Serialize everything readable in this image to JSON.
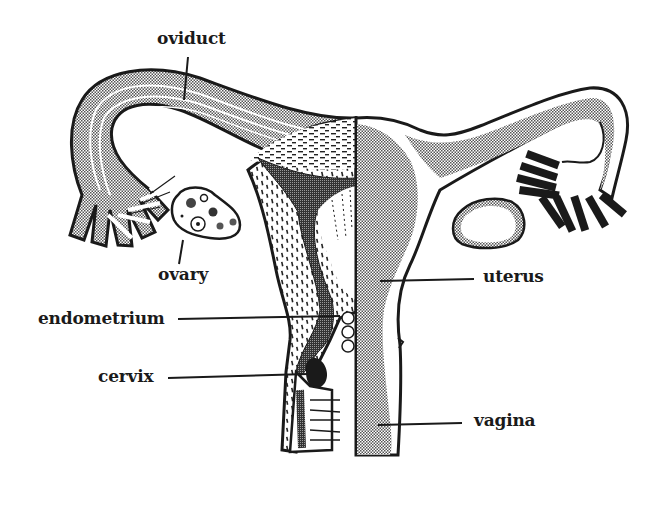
{
  "diagram": {
    "colors": {
      "ink": "#1a1a1a",
      "stipple": "#b8b8b8",
      "background": "#ffffff"
    },
    "labels": {
      "oviduct": "oviduct",
      "ovary": "ovary",
      "endometrium": "endometrium",
      "cervix": "cervix",
      "uterus": "uterus",
      "vagina": "vagina"
    }
  }
}
